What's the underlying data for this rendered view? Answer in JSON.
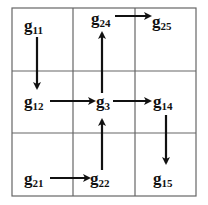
{
  "diagram": {
    "type": "grid-graph",
    "grid": {
      "rows": 3,
      "cols": 3,
      "line_color": "#555555"
    },
    "nodes": [
      {
        "id": "g11",
        "base": "g",
        "sub": "11",
        "cell": [
          0,
          0
        ],
        "x": 26,
        "y": 16
      },
      {
        "id": "g24",
        "base": "g",
        "sub": "24",
        "cell": [
          0,
          1
        ],
        "x": 92,
        "y": 11
      },
      {
        "id": "g25",
        "base": "g",
        "sub": "25",
        "cell": [
          0,
          1
        ],
        "x": 153,
        "y": 14
      },
      {
        "id": "g12",
        "base": "g",
        "sub": "12",
        "cell": [
          1,
          0
        ],
        "x": 26,
        "y": 97
      },
      {
        "id": "g3",
        "base": "g",
        "sub": "3",
        "cell": [
          1,
          1
        ],
        "x": 98,
        "y": 97
      },
      {
        "id": "g14",
        "base": "g",
        "sub": "14",
        "cell": [
          1,
          2
        ],
        "x": 154,
        "y": 97
      },
      {
        "id": "g21",
        "base": "g",
        "sub": "21",
        "cell": [
          2,
          0
        ],
        "x": 26,
        "y": 172
      },
      {
        "id": "g22",
        "base": "g",
        "sub": "22",
        "cell": [
          2,
          1
        ],
        "x": 92,
        "y": 172
      },
      {
        "id": "g15",
        "base": "g",
        "sub": "15",
        "cell": [
          2,
          2
        ],
        "x": 154,
        "y": 172
      }
    ],
    "edges": [
      {
        "from": "g11",
        "to": "g12"
      },
      {
        "from": "g12",
        "to": "g3"
      },
      {
        "from": "g3",
        "to": "g24"
      },
      {
        "from": "g24",
        "to": "g25"
      },
      {
        "from": "g3",
        "to": "g14"
      },
      {
        "from": "g14",
        "to": "g15"
      },
      {
        "from": "g21",
        "to": "g22"
      },
      {
        "from": "g22",
        "to": "g3"
      }
    ]
  }
}
